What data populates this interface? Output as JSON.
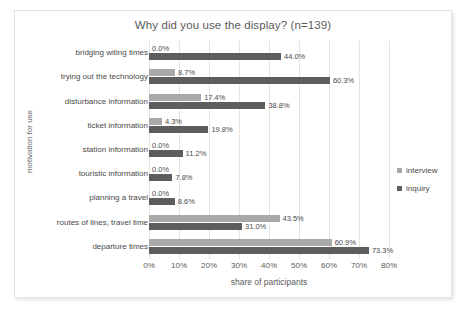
{
  "chart_data": {
    "type": "bar",
    "orientation": "horizontal",
    "title": "Why did you use the display? (n=139)",
    "xlabel": "share of participants",
    "ylabel": "motivation for use",
    "xlim": [
      0,
      80
    ],
    "xtick_labels": [
      "0%",
      "10%",
      "20%",
      "30%",
      "40%",
      "50%",
      "60%",
      "70%",
      "80%"
    ],
    "xticks": [
      0,
      10,
      20,
      30,
      40,
      50,
      60,
      70,
      80
    ],
    "grid": true,
    "legend_position": "right",
    "categories": [
      "bridging witing times",
      "trying out the technology",
      "disturbance information",
      "ticket information",
      "station information",
      "touristic information",
      "planning a travel",
      "routes of lines, travel time",
      "departure times"
    ],
    "series": [
      {
        "name": "interview",
        "color": "#a9a9a9",
        "values": [
          0.0,
          8.7,
          17.4,
          4.3,
          0.0,
          0.0,
          0.0,
          43.5,
          60.9
        ],
        "labels": [
          "0.0%",
          "8.7%",
          "17.4%",
          "4.3%",
          "0.0%",
          "0.0%",
          "0.0%",
          "43.5%",
          "60.9%"
        ]
      },
      {
        "name": "inquiry",
        "color": "#5e5e5e",
        "values": [
          44.0,
          60.3,
          38.8,
          19.8,
          11.2,
          7.8,
          8.6,
          31.0,
          73.3
        ],
        "labels": [
          "44.0%",
          "60.3%",
          "38.8%",
          "19.8%",
          "11.2%",
          "7.8%",
          "8.6%",
          "31.0%",
          "73.3%"
        ]
      }
    ]
  }
}
